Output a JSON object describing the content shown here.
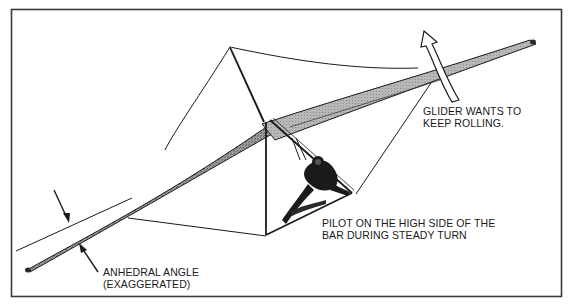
{
  "figure": {
    "colors": {
      "ink": "#1a1a1a",
      "frame": "#3a3a3a",
      "wing_fill_dark": "#8a8a8a",
      "wing_fill_light": "#b5b5b5",
      "background": "#ffffff"
    }
  },
  "annotations": {
    "roll": {
      "line1": "GLIDER WANTS TO",
      "line2": "KEEP ROLLING."
    },
    "pilot": {
      "line1": "PILOT ON THE HIGH SIDE OF THE",
      "line2": "BAR DURING STEADY TURN"
    },
    "anhedral": {
      "line1": "ANHEDRAL ANGLE",
      "line2": "(EXAGGERATED)"
    }
  }
}
